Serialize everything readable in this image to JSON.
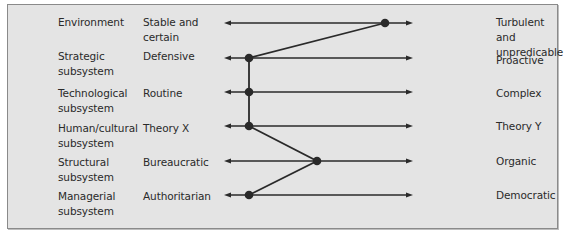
{
  "diagram": {
    "rows": [
      {
        "subsystem": "Environment",
        "left_pole": "Stable and certain",
        "right_pole": "Turbulent and unpredicable",
        "y": 23,
        "position_x": 385
      },
      {
        "subsystem": "Strategic subsystem",
        "left_pole": "Defensive",
        "right_pole": "Proactive",
        "y": 58,
        "position_x": 249
      },
      {
        "subsystem": "Technological subsystem",
        "left_pole": "Routine",
        "right_pole": "Complex",
        "y": 92,
        "position_x": 249
      },
      {
        "subsystem": "Human/cultural subsystem",
        "left_pole": "Theory X",
        "right_pole": "Theory Y",
        "y": 126,
        "position_x": 249
      },
      {
        "subsystem": "Structural subsystem",
        "left_pole": "Bureaucratic",
        "right_pole": "Organic",
        "y": 161,
        "position_x": 317
      },
      {
        "subsystem": "Managerial subsystem",
        "left_pole": "Authoritarian",
        "right_pole": "Democratic",
        "y": 195,
        "position_x": 249
      }
    ],
    "scale": {
      "left_x": 224,
      "right_x": 413
    },
    "colors": {
      "background": "#e4e4e4",
      "border": "#8a8a8a",
      "line": "#2a2a2a",
      "text": "#2a2a2a"
    }
  }
}
